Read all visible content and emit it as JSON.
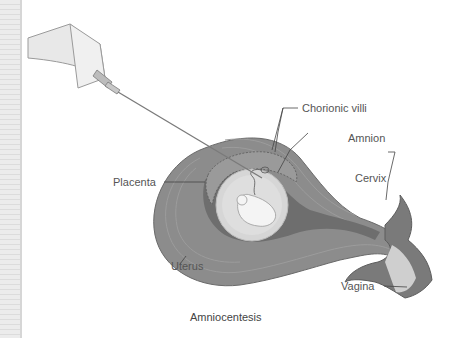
{
  "figure": {
    "caption": "Amniocentesis",
    "labels": {
      "chorionic_villi": "Chorionic villi",
      "amnion": "Amnion",
      "placenta": "Placenta",
      "cervix": "Cervix",
      "uterus": "Uterus",
      "vagina": "Vagina"
    },
    "colors": {
      "uterus_wall": "#8a8a8a",
      "uterus_wall_light": "#9a9a9a",
      "inner_cavity": "#6e6e6e",
      "amniotic_sac": "#d8d8d8",
      "fetus": "#f2f2f2",
      "syringe": "#e6e6e6",
      "label_text": "#555555"
    }
  }
}
